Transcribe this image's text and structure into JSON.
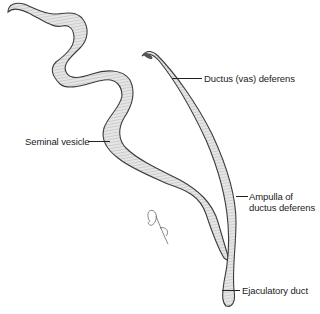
{
  "figure": {
    "type": "anatomical illustration",
    "labels": {
      "ductus_deferens": "Ductus (vas) deferens",
      "seminal_vesicle": "Seminal vesicle",
      "ampulla_line1": "Ampulla of",
      "ampulla_line2": "ductus deferens",
      "ejaculatory_duct": "Ejaculatory duct"
    },
    "colors": {
      "outline": "#3a3a3a",
      "fill": "#e4e4e4",
      "shade": "#8a8a8a",
      "text": "#222222"
    }
  }
}
